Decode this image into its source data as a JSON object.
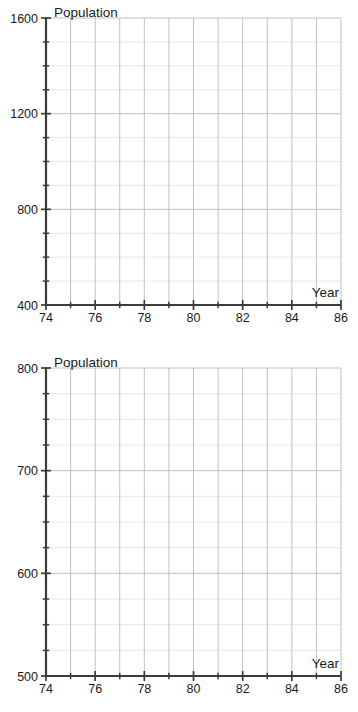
{
  "page": {
    "background": "#ffffff",
    "width": 358,
    "height": 712
  },
  "style": {
    "axis_color": "#3b3b3b",
    "grid_major_color": "#b9b9b9",
    "grid_minor_color": "#e2e2e2",
    "text_color": "#1a1a1a"
  },
  "charts": [
    {
      "id": "top",
      "y_axis_title": "Population",
      "x_axis_title": "Year",
      "x_labels": [
        "74",
        "76",
        "78",
        "80",
        "82",
        "84",
        "86"
      ],
      "y_labels": [
        "1600",
        "1200",
        "800",
        "400"
      ]
    },
    {
      "id": "bottom",
      "y_axis_title": "Population",
      "x_axis_title": "Year",
      "x_labels": [
        "74",
        "76",
        "78",
        "80",
        "82",
        "84",
        "86"
      ],
      "y_labels": [
        "800",
        "700",
        "600",
        "500"
      ]
    }
  ],
  "chart_data": [
    {
      "type": "line",
      "title": "",
      "subtitle": "",
      "xlabel": "Year",
      "ylabel": "Population",
      "xlim": [
        74,
        86
      ],
      "ylim": [
        400,
        1600
      ],
      "x_major_ticks": [
        74,
        76,
        78,
        80,
        82,
        84,
        86
      ],
      "x_minor_ticks": [
        75,
        77,
        79,
        81,
        83,
        85
      ],
      "x_tick_labels": [
        "74",
        "76",
        "78",
        "80",
        "82",
        "84",
        "86"
      ],
      "y_major_ticks": [
        400,
        800,
        1200,
        1600
      ],
      "y_minor_ticks": [
        500,
        600,
        700,
        900,
        1000,
        1100,
        1300,
        1400,
        1500
      ],
      "y_tick_labels": [
        "400",
        "800",
        "1200",
        "1600"
      ],
      "grid": true,
      "grid_x_step": 1,
      "grid_y_step": 100,
      "legend": false,
      "legend_position": "none",
      "series": [],
      "annotations": [],
      "note": "Empty plotting grid — no data plotted"
    },
    {
      "type": "line",
      "title": "",
      "subtitle": "",
      "xlabel": "Year",
      "ylabel": "Population",
      "xlim": [
        74,
        86
      ],
      "ylim": [
        500,
        800
      ],
      "x_major_ticks": [
        74,
        76,
        78,
        80,
        82,
        84,
        86
      ],
      "x_minor_ticks": [
        75,
        77,
        79,
        81,
        83,
        85
      ],
      "x_tick_labels": [
        "74",
        "76",
        "78",
        "80",
        "82",
        "84",
        "86"
      ],
      "y_major_ticks": [
        500,
        600,
        700,
        800
      ],
      "y_minor_ticks": [
        525,
        550,
        575,
        625,
        650,
        675,
        725,
        750,
        775
      ],
      "y_tick_labels": [
        "500",
        "600",
        "700",
        "800"
      ],
      "grid": true,
      "grid_x_step": 1,
      "grid_y_step": 25,
      "legend": false,
      "legend_position": "none",
      "series": [],
      "annotations": [],
      "note": "Empty plotting grid — no data plotted"
    }
  ]
}
